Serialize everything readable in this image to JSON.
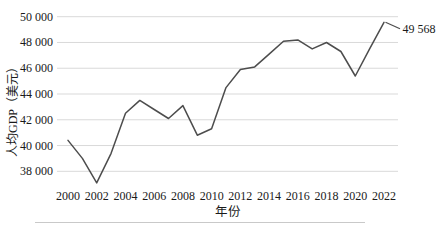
{
  "chart_data": {
    "type": "line",
    "title": "",
    "xlabel": "年份",
    "ylabel": "人均GDP（美元）",
    "x": [
      2000,
      2001,
      2002,
      2003,
      2004,
      2005,
      2006,
      2007,
      2008,
      2009,
      2010,
      2011,
      2012,
      2013,
      2014,
      2015,
      2016,
      2017,
      2018,
      2019,
      2020,
      2021,
      2022
    ],
    "values": [
      40400,
      39000,
      37100,
      39400,
      42500,
      43500,
      42800,
      42100,
      43100,
      40800,
      41300,
      44500,
      45900,
      46100,
      47100,
      48100,
      48200,
      47500,
      48000,
      47300,
      45400,
      47500,
      49568
    ],
    "x_tick_labels": [
      "2000",
      "2002",
      "2004",
      "2006",
      "2008",
      "2010",
      "2012",
      "2014",
      "2016",
      "2018",
      "2020",
      "2022"
    ],
    "y_tick_labels": [
      "38 000",
      "40 000",
      "42 000",
      "44 000",
      "46 000",
      "48 000",
      "50 000"
    ],
    "y_tick_values": [
      38000,
      40000,
      42000,
      44000,
      46000,
      48000,
      50000
    ],
    "ylim": [
      36000,
      51000
    ],
    "xlim": [
      2000,
      2022
    ],
    "grid": "horizontal",
    "legend": "none",
    "annotation": {
      "text": "49 568",
      "x": 2022,
      "value": 49568
    },
    "colors": {
      "line": "#4d4d4d",
      "grid": "#d9d9d9",
      "text": "#1a1a1a"
    }
  }
}
